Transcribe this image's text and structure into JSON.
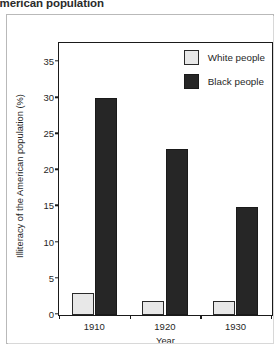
{
  "title": "of the American population",
  "chart_data": {
    "type": "bar",
    "title": "of the American population",
    "xlabel": "Year",
    "ylabel": "Illiteracy of the American population (%)",
    "categories": [
      "1910",
      "1920",
      "1930"
    ],
    "series": [
      {
        "name": "White people",
        "values": [
          3,
          2,
          2
        ],
        "color": "#e8e8e8"
      },
      {
        "name": "Black people",
        "values": [
          30,
          23,
          15
        ],
        "color": "#262626"
      }
    ],
    "ylim": [
      0,
      37.5
    ],
    "yticks": [
      0,
      5,
      10,
      15,
      20,
      25,
      30,
      35
    ],
    "ytick_labels": [
      "0",
      "5",
      "10",
      "15",
      "20",
      "25",
      "30",
      "35"
    ],
    "grid": false,
    "legend_position": "top-right"
  },
  "colors": {
    "white_series": "#e8e8e8",
    "black_series": "#262626",
    "axis": "#1a1a1a",
    "text": "#1f1f1f",
    "outer_frame": "#b9b9b9",
    "background": "#ffffff"
  }
}
